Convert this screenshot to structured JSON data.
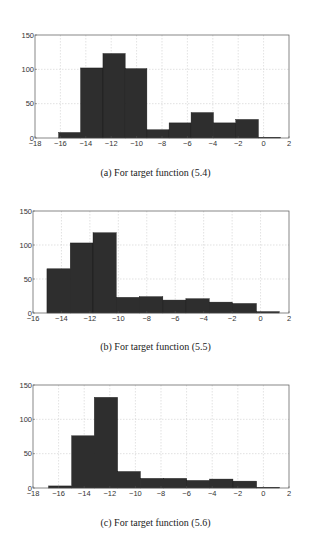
{
  "chart_data": [
    {
      "type": "bar",
      "subtype": "histogram",
      "title": "",
      "caption": "(a) For target function (5.4)",
      "xlabel": "",
      "ylabel": "",
      "xlim": [
        -18,
        2
      ],
      "ylim": [
        0,
        150
      ],
      "xticks": [
        -18,
        -16,
        -14,
        -12,
        -10,
        -8,
        -6,
        -4,
        -2,
        0,
        2
      ],
      "yticks": [
        0,
        50,
        100,
        150
      ],
      "grid": true,
      "bin_edges": [
        -16.14,
        -14.41,
        -12.65,
        -10.9,
        -9.19,
        -7.44,
        -5.71,
        -3.95,
        -2.19,
        -0.41,
        1.34
      ],
      "values": [
        8,
        102,
        123,
        101,
        12,
        22,
        37,
        22,
        27,
        1
      ],
      "bar_color": "#2e2e2e"
    },
    {
      "type": "bar",
      "subtype": "histogram",
      "title": "",
      "caption": "(b) For target function (5.5)",
      "xlabel": "",
      "ylabel": "",
      "xlim": [
        -16,
        2
      ],
      "ylim": [
        0,
        150
      ],
      "xticks": [
        -16,
        -14,
        -12,
        -10,
        -8,
        -6,
        -4,
        -2,
        0,
        2
      ],
      "yticks": [
        0,
        50,
        100,
        150
      ],
      "grid": true,
      "bin_edges": [
        -15.02,
        -13.38,
        -11.78,
        -10.15,
        -8.53,
        -6.87,
        -5.25,
        -3.61,
        -1.99,
        -0.29,
        1.31
      ],
      "values": [
        65,
        103,
        118,
        23,
        24,
        19,
        21,
        16,
        14,
        2
      ],
      "bar_color": "#2e2e2e"
    },
    {
      "type": "bar",
      "subtype": "histogram",
      "title": "",
      "caption": "(c) For target function (5.6)",
      "xlabel": "",
      "ylabel": "",
      "xlim": [
        -18,
        2
      ],
      "ylim": [
        0,
        150
      ],
      "xticks": [
        -18,
        -16,
        -14,
        -12,
        -10,
        -8,
        -6,
        -4,
        -2,
        0,
        2
      ],
      "yticks": [
        0,
        50,
        100,
        150
      ],
      "grid": true,
      "bin_edges": [
        -16.78,
        -14.98,
        -13.21,
        -11.39,
        -9.61,
        -7.82,
        -5.99,
        -4.2,
        -2.38,
        -0.53,
        1.27
      ],
      "values": [
        3,
        76,
        132,
        24,
        14,
        14,
        11,
        13,
        10,
        1
      ],
      "bar_color": "#2e2e2e"
    }
  ],
  "panels": [
    {
      "caption": "(a) For target function (5.4)"
    },
    {
      "caption": "(b) For target function (5.5)"
    },
    {
      "caption": "(c) For target function (5.6)"
    }
  ]
}
